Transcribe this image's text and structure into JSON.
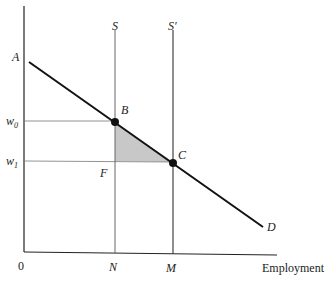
{
  "diagram": {
    "type": "labor-market-supply-demand",
    "x_axis": {
      "label": "Employment",
      "origin_label": "0"
    },
    "y_axis": {
      "label": ""
    },
    "demand_curve": {
      "start_label": "A",
      "end_label": "D"
    },
    "supply_curves": [
      {
        "label": "S",
        "position_label": "N"
      },
      {
        "label": "S′",
        "position_label": "M"
      }
    ],
    "wage_levels": [
      {
        "label": "w",
        "subscript": "0"
      },
      {
        "label": "w",
        "subscript": "1"
      }
    ],
    "points": [
      {
        "label": "B"
      },
      {
        "label": "C"
      },
      {
        "label": "F"
      }
    ],
    "shaded_region": {
      "vertices": [
        "B",
        "F",
        "C"
      ],
      "color": "#c8c8c8"
    },
    "colors": {
      "line": "#111111",
      "guide": "#555555",
      "shade": "#c8c8c8"
    }
  }
}
